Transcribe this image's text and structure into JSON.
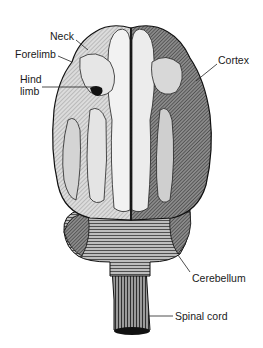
{
  "figure": {
    "labels": {
      "neck": "Neck",
      "forelimb": "Forelimb",
      "hind_limb_line1": "Hind",
      "hind_limb_line2": "limb",
      "cortex": "Cortex",
      "cerebellum": "Cerebellum",
      "spinal_cord": "Spinal cord"
    },
    "colors": {
      "background": "#ffffff",
      "ink": "#1a1a1a",
      "light_fill": "#e8e8e8",
      "mid_fill": "#9a9a9a",
      "dark_fill": "#4a4a4a"
    }
  }
}
